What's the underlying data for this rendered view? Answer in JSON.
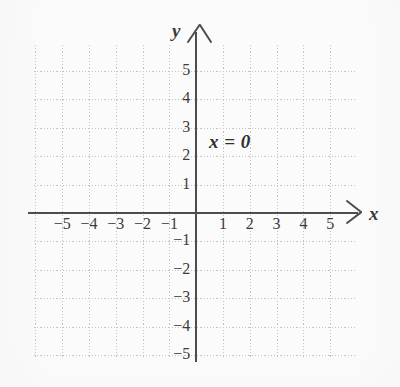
{
  "figure": {
    "type": "coordinate-plane",
    "background_color": "#fbfbfb",
    "axis_color": "#4d4d4d",
    "grid_color": "#c4c4c4",
    "text_color": "#3c3c3c"
  },
  "axes": {
    "x_label": "x",
    "y_label": "y",
    "x_arrow": "arrow-right",
    "y_arrow": "arrow-up"
  },
  "annotation": {
    "equation": "x = 0"
  },
  "chart_data": {
    "type": "line",
    "title": "",
    "subtitle": "",
    "xlabel": "x",
    "ylabel": "y",
    "xlim": [
      -5.75,
      5.75
    ],
    "ylim": [
      -5.6,
      5.6
    ],
    "grid": true,
    "grid_step": 1,
    "legend": "none",
    "annotations": [
      {
        "text": "x = 0",
        "x": 0.5,
        "y": 2.6
      }
    ],
    "series": [
      {
        "name": "x = 0",
        "kind": "vertical-line",
        "equation": "x = 0",
        "x": 0,
        "note": "the line x = 0 coincides with the y-axis",
        "points": [
          [
            0,
            -5.6
          ],
          [
            0,
            5.6
          ]
        ]
      }
    ],
    "xticks": [
      -5,
      -4,
      -3,
      -2,
      -1,
      1,
      2,
      3,
      4,
      5
    ],
    "xtick_labels": [
      "−5",
      "−4",
      "−3",
      "−2",
      "−1",
      "1",
      "2",
      "3",
      "4",
      "5"
    ],
    "yticks": [
      5,
      4,
      3,
      2,
      1,
      -1,
      -2,
      -3,
      -4,
      -5
    ],
    "ytick_labels": [
      "5",
      "4",
      "3",
      "2",
      "1",
      "−1",
      "−2",
      "−3",
      "−4",
      "−5"
    ]
  }
}
